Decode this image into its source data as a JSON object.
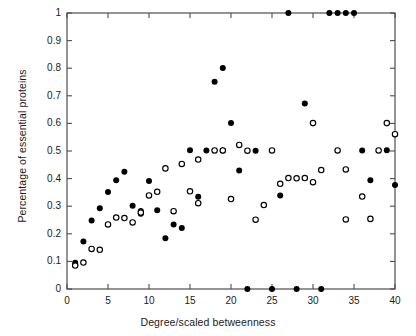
{
  "chart_data": {
    "type": "scatter",
    "title": "",
    "xlabel": "Degree/scaled betweenness",
    "ylabel": "Percentage of essential proteins",
    "xlim": [
      0,
      40
    ],
    "ylim": [
      0,
      1
    ],
    "xticks": [
      0,
      5,
      10,
      15,
      20,
      25,
      30,
      35,
      40
    ],
    "xtick_labels": [
      "0",
      "5",
      "10",
      "15",
      "20",
      "25",
      "30",
      "35",
      "40"
    ],
    "yticks": [
      0,
      0.1,
      0.2,
      0.3,
      0.4,
      0.5,
      0.6,
      0.7,
      0.8,
      0.9,
      1
    ],
    "ytick_labels": [
      "0",
      "0.1",
      "0.2",
      "0.3",
      "0.4",
      "0.5",
      "0.6",
      "0.7",
      "0.8",
      "0.9",
      "1"
    ],
    "grid": false,
    "legend": null,
    "series": [
      {
        "name": "Degree",
        "marker": "filled-circle",
        "color": "#000000",
        "points": [
          [
            1,
            0.095
          ],
          [
            2,
            0.172
          ],
          [
            3,
            0.248
          ],
          [
            4,
            0.293
          ],
          [
            5,
            0.351
          ],
          [
            6,
            0.394
          ],
          [
            7,
            0.425
          ],
          [
            8,
            0.302
          ],
          [
            9,
            0.283
          ],
          [
            9,
            0.273
          ],
          [
            10,
            0.391
          ],
          [
            11,
            0.285
          ],
          [
            12,
            0.184
          ],
          [
            13,
            0.234
          ],
          [
            14,
            0.221
          ],
          [
            15,
            0.503
          ],
          [
            16,
            0.334
          ],
          [
            17,
            0.502
          ],
          [
            18,
            0.751
          ],
          [
            19,
            0.801
          ],
          [
            19,
            0.502
          ],
          [
            20,
            0.601
          ],
          [
            21,
            0.429
          ],
          [
            22,
            0.0
          ],
          [
            23,
            0.501
          ],
          [
            25,
            0.0
          ],
          [
            26,
            0.339
          ],
          [
            28,
            0.0
          ],
          [
            27,
            1.0
          ],
          [
            29,
            0.672
          ],
          [
            31,
            0.0
          ],
          [
            32,
            1.0
          ],
          [
            33,
            1.0
          ],
          [
            34,
            1.0
          ],
          [
            35,
            1.0
          ],
          [
            36,
            0.502
          ],
          [
            37,
            0.394
          ],
          [
            39,
            0.503
          ],
          [
            40,
            0.377
          ]
        ]
      },
      {
        "name": "Scaled betweenness",
        "marker": "open-circle",
        "color": "#000000",
        "points": [
          [
            1,
            0.085
          ],
          [
            2,
            0.096
          ],
          [
            3,
            0.145
          ],
          [
            4,
            0.142
          ],
          [
            5,
            0.234
          ],
          [
            6,
            0.259
          ],
          [
            7,
            0.257
          ],
          [
            8,
            0.241
          ],
          [
            9,
            0.277
          ],
          [
            10,
            0.339
          ],
          [
            11,
            0.352
          ],
          [
            12,
            0.437
          ],
          [
            13,
            0.282
          ],
          [
            14,
            0.453
          ],
          [
            16,
            0.469
          ],
          [
            16,
            0.311
          ],
          [
            15,
            0.354
          ],
          [
            18,
            0.502
          ],
          [
            19,
            0.502
          ],
          [
            21,
            0.522
          ],
          [
            20,
            0.326
          ],
          [
            22,
            0.501
          ],
          [
            23,
            0.251
          ],
          [
            24,
            0.304
          ],
          [
            25,
            0.502
          ],
          [
            26,
            0.381
          ],
          [
            27,
            0.402
          ],
          [
            28,
            0.401
          ],
          [
            29,
            0.402
          ],
          [
            30,
            0.387
          ],
          [
            31,
            0.431
          ],
          [
            30,
            0.601
          ],
          [
            33,
            0.502
          ],
          [
            34,
            0.433
          ],
          [
            34,
            0.252
          ],
          [
            36,
            0.335
          ],
          [
            37,
            0.254
          ],
          [
            38,
            0.502
          ],
          [
            39,
            0.601
          ],
          [
            40,
            0.561
          ]
        ]
      }
    ]
  },
  "axes": {
    "x_pixel_min": 67,
    "x_pixel_max": 395,
    "y_pixel_min": 289,
    "y_pixel_max": 13
  }
}
